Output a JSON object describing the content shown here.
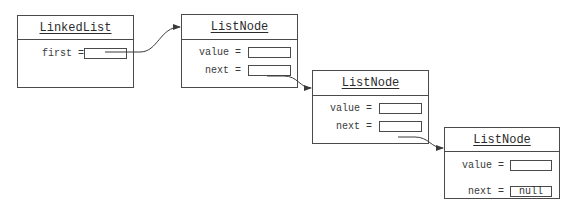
{
  "diagram": {
    "objects": [
      {
        "id": "linkedlist",
        "title": "LinkedList",
        "fields": [
          {
            "label": "first =",
            "value": ""
          }
        ]
      },
      {
        "id": "node1",
        "title": "ListNode",
        "fields": [
          {
            "label": "value =",
            "value": ""
          },
          {
            "label": "next =",
            "value": ""
          }
        ]
      },
      {
        "id": "node2",
        "title": "ListNode",
        "fields": [
          {
            "label": "value =",
            "value": ""
          },
          {
            "label": "next =",
            "value": ""
          }
        ]
      },
      {
        "id": "node3",
        "title": "ListNode",
        "fields": [
          {
            "label": "value =",
            "value": ""
          },
          {
            "label": "next =",
            "value": "null"
          }
        ]
      }
    ],
    "references": [
      {
        "from": "linkedlist.first",
        "to": "node1"
      },
      {
        "from": "node1.next",
        "to": "node2"
      },
      {
        "from": "node2.next",
        "to": "node3"
      }
    ],
    "colors": {
      "stroke": "#4a4a4a",
      "text": "#333333",
      "background": "#ffffff"
    }
  }
}
